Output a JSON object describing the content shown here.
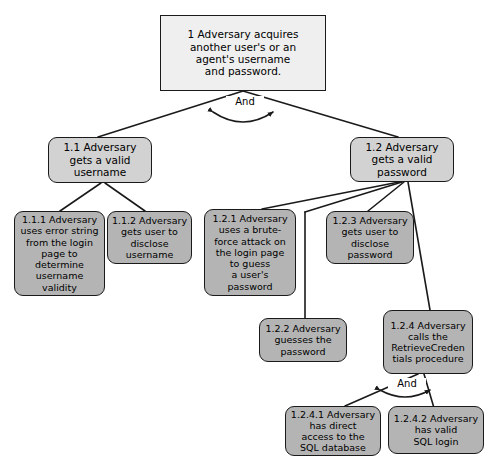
{
  "diagram": {
    "canvas": {
      "width": 490,
      "height": 463
    },
    "colors": {
      "background": "#ffffff",
      "root_fill": "#efefef",
      "level2_fill": "#d2d2d2",
      "leaf_fill": "#b4b4b4",
      "stroke": "#1a1a1a",
      "text": "#000000"
    },
    "gates": {
      "root_gate": "And",
      "node_124_gate": "And"
    },
    "nodes": {
      "root": {
        "id": "1",
        "label": "1 Adversary acquires\nanother user's or an\nagent's username\nand password."
      },
      "n11": {
        "id": "1.1",
        "label": "1.1 Adversary\ngets a valid\nusername"
      },
      "n12": {
        "id": "1.2",
        "label": "1.2 Adversary\ngets a valid\npassword"
      },
      "n111": {
        "id": "1.1.1",
        "label": "1.1.1 Adversary\nuses error string\nfrom the login\npage to\ndetermine\nusername\nvalidity"
      },
      "n112": {
        "id": "1.1.2",
        "label": "1.1.2 Adversary\ngets user to\ndisclose\nusername"
      },
      "n121": {
        "id": "1.2.1",
        "label": "1.2.1 Adversary\nuses a brute-\nforce attack on\nthe login page\nto guess\na user's\npassword"
      },
      "n122": {
        "id": "1.2.2",
        "label": "1.2.2 Adversary\nguesses the\npassword"
      },
      "n123": {
        "id": "1.2.3",
        "label": "1.2.3 Adversary\ngets user to\ndisclose\npassword"
      },
      "n124": {
        "id": "1.2.4",
        "label": "1.2.4 Adversary\ncalls the\nRetrieveCreden\ntials procedure"
      },
      "n1241": {
        "id": "1.2.4.1",
        "label": "1.2.4.1 Adversary\nhas direct\naccess to the\nSQL database"
      },
      "n1242": {
        "id": "1.2.4.2",
        "label": "1.2.4.2 Adversary\nhas valid\nSQL login"
      }
    }
  }
}
